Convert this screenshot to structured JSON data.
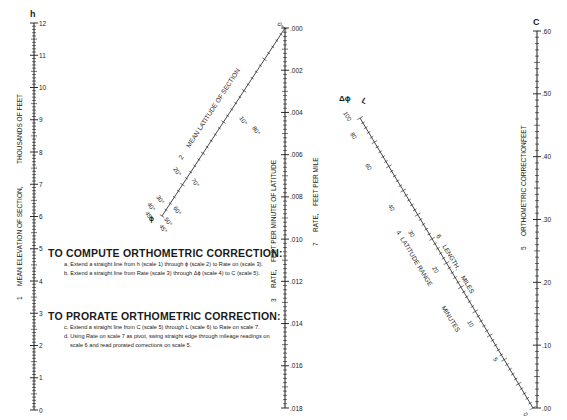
{
  "scales": {
    "h": {
      "symbol": "h",
      "number": "1",
      "title": "MEAN ELEVATION OF SECTION,",
      "unit": "THOUSANDS OF FEET",
      "ticks": [
        "0",
        "1",
        "2",
        "3",
        "4",
        "5",
        "6",
        "7",
        "8",
        "9",
        "10",
        "11",
        "12"
      ]
    },
    "phi": {
      "number": "2",
      "title": "MEAN LATITUDE OF SECTION",
      "labels_upper": [
        "0°",
        "10°",
        "20°",
        "30°",
        "40°",
        "45°"
      ],
      "labels_lower": [
        "90°",
        "80°",
        "70°",
        "60°",
        "50°",
        "45°"
      ],
      "phi_symbol": "ϕ"
    },
    "rate3": {
      "number": "3",
      "title": "RATE,",
      "unit": "FEET PER MINUTE OF LATITUDE",
      "ticks": [
        ".000",
        ".002",
        ".004",
        ".006",
        ".008",
        ".010",
        ".012",
        ".014",
        ".016",
        ".018"
      ]
    },
    "rate7": {
      "number": "7",
      "title": "RATE,",
      "unit": "FEET PER MILE"
    },
    "dphi": {
      "number": "4",
      "symbol": "Δϕ",
      "title": "LATITUDE RANGE",
      "unit": "MINUTES",
      "labels": [
        "100",
        "80",
        "60",
        "40",
        "30",
        "20",
        "10",
        "5",
        "0"
      ]
    },
    "L": {
      "number": "6",
      "symbol": "L",
      "title": "LENGTH,",
      "unit": "MILES"
    },
    "C": {
      "symbol": "C",
      "number": "5",
      "title": "ORTHOMETRIC CORRECTION,",
      "unit": "FEET",
      "ticks": [
        ".00",
        ".10",
        ".20",
        ".30",
        ".40",
        ".50",
        ".60"
      ]
    }
  },
  "instructions": {
    "compute": {
      "heading": "TO COMPUTE ORTHOMETRIC CORRECTION:",
      "steps": [
        "a. Extend a straight line from h (scale 1) through ϕ (scale 2) to Rate on (scale 3).",
        "b. Extend a straight line from Rate (scale 3) through Δϕ (scale 4) to C (scale 5)."
      ]
    },
    "prorate": {
      "heading": "TO PRORATE ORTHOMETRIC CORRECTION:",
      "steps": [
        "c. Extend a straight line from C (scale 5) through L (scale 6) to Rate on scale 7.",
        "d. Using Rate on scale 7 as pivot, swing straight edge through mileage readings on scale 6 and read prorated corrections on scale 5."
      ]
    }
  },
  "colors": {
    "ink": "#1a1a1a",
    "paper": "#ffffff"
  }
}
